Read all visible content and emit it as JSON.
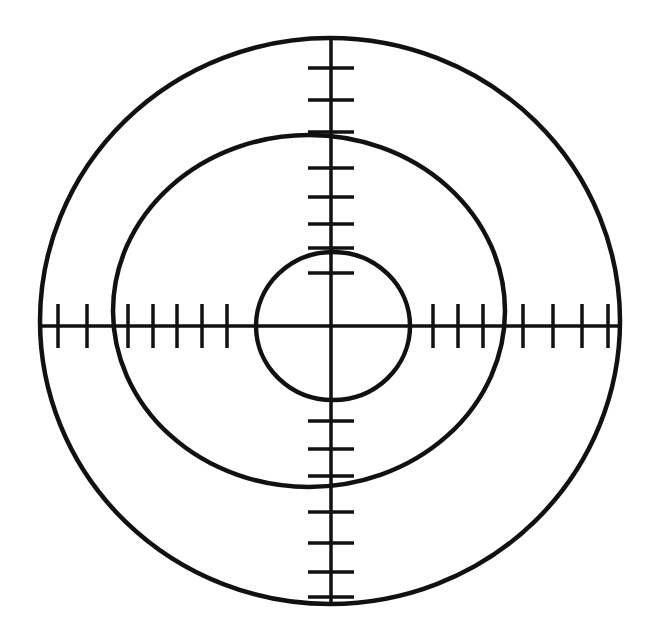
{
  "figure": {
    "name": "telescopic-sight-reticle",
    "title": "Reticle crosshair with concentric rings and graduated scale ticks",
    "background_color": "#ffffff",
    "stroke_color": "#111111",
    "canvas": {
      "width": 659,
      "height": 642
    }
  },
  "chart_data": {
    "type": "diagram",
    "title": "Reticle crosshair with concentric rings and graduated scale ticks",
    "xlabel": "",
    "ylabel": "",
    "grid": false,
    "legend": null,
    "center": {
      "x": 331,
      "y": 326
    },
    "rings": [
      {
        "name": "outer-circle",
        "shape": "ellipse",
        "cx": 330,
        "cy": 321,
        "rx": 290,
        "ry": 283,
        "stroke_width": 4.5,
        "fill": "none"
      },
      {
        "name": "middle-ellipse",
        "shape": "ellipse",
        "cx": 309,
        "cy": 311,
        "rx": 196,
        "ry": 176,
        "stroke_width": 4.5,
        "fill": "none"
      },
      {
        "name": "inner-circle",
        "shape": "ellipse",
        "cx": 333,
        "cy": 326,
        "rx": 77,
        "ry": 74,
        "stroke_width": 4.5,
        "fill": "none"
      }
    ],
    "axes": [
      {
        "name": "vertical-axis",
        "orientation": "vertical",
        "x": 331,
        "y1": 38,
        "y2": 604,
        "stroke_width": 3.5
      },
      {
        "name": "horizontal-axis",
        "orientation": "horizontal",
        "y": 326,
        "x1": 41,
        "x2": 620,
        "stroke_width": 3.5
      }
    ],
    "arms": [
      {
        "name": "top-arm",
        "direction": "up",
        "tick_count": 8,
        "tick_half_length": 23,
        "ticks": [
          68,
          100,
          132,
          168,
          197,
          224,
          248,
          273
        ]
      },
      {
        "name": "bottom-arm",
        "direction": "down",
        "tick_count": 7,
        "tick_half_length": 23,
        "ticks": [
          421,
          449,
          476,
          512,
          543,
          572,
          597
        ]
      },
      {
        "name": "left-arm",
        "direction": "left",
        "tick_count": 7,
        "tick_half_length": 22,
        "ticks": [
          58,
          87,
          128,
          153,
          177,
          202,
          227
        ]
      },
      {
        "name": "right-arm",
        "direction": "right",
        "tick_count": 7,
        "tick_half_length": 22,
        "ticks": [
          433,
          458,
          483,
          523,
          553,
          582,
          608
        ]
      }
    ],
    "tick_stroke_width": 3.5
  }
}
